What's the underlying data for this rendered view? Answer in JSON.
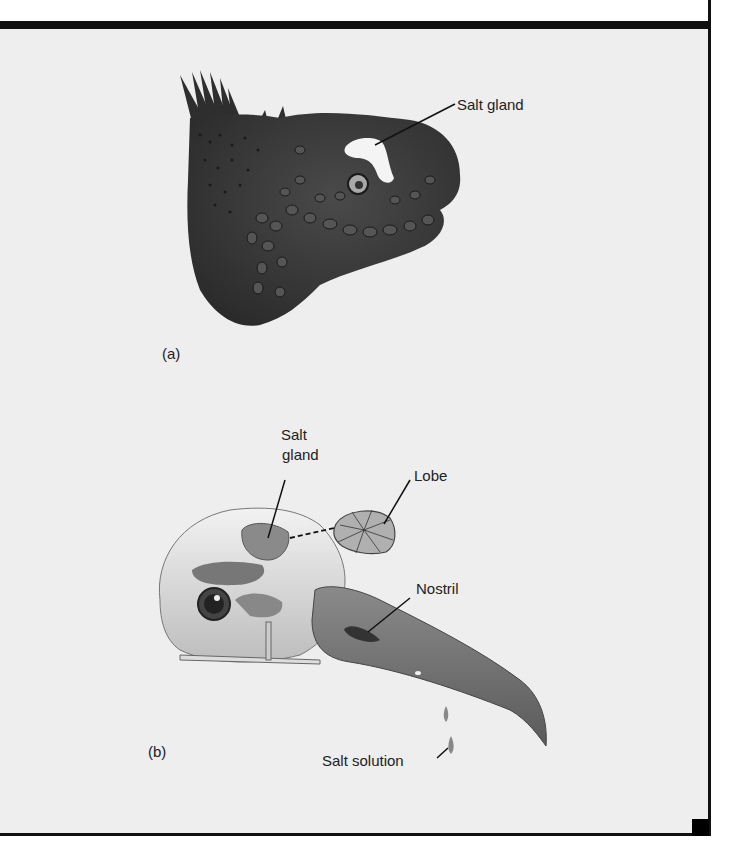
{
  "figure": {
    "panels": [
      {
        "id": "a",
        "label": "(a)",
        "subject": "marine iguana head",
        "callouts": [
          {
            "text": "Salt gland"
          }
        ]
      },
      {
        "id": "b",
        "label": "(b)",
        "subject": "seabird skull",
        "callouts": [
          {
            "text_line1": "Salt",
            "text_line2": "gland"
          },
          {
            "text": "Lobe"
          },
          {
            "text": "Nostril"
          },
          {
            "text": "Salt solution"
          }
        ]
      }
    ],
    "colors": {
      "background": "#eeeeee",
      "frame": "#111111",
      "iguana_skin": "#3a3a3a",
      "gland_highlight": "#f4f4f4",
      "bone": "#d9d9d9",
      "beak": "#6e6e6e",
      "label_text": "#222222"
    }
  }
}
